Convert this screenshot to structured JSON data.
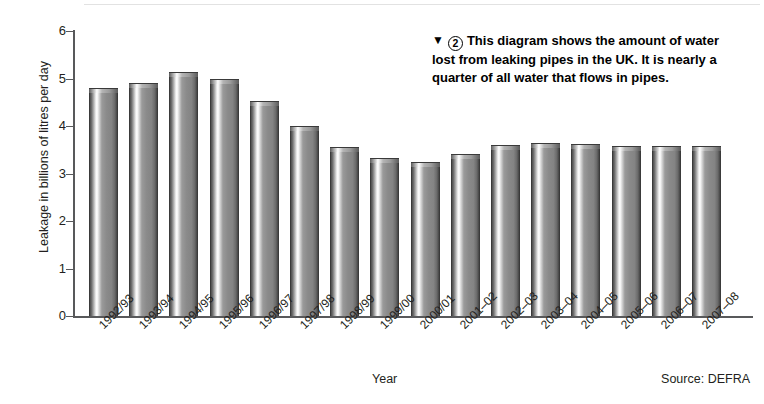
{
  "chart_data": {
    "type": "bar",
    "title": "",
    "xlabel": "Year",
    "ylabel": "Leakage in billions of litres per day",
    "ylim": [
      0,
      6
    ],
    "yticks": [
      0,
      1,
      2,
      3,
      4,
      5,
      6
    ],
    "grid": false,
    "legend": null,
    "categories": [
      "1992/93",
      "1993/94",
      "1994/95",
      "1995/96",
      "1996/97",
      "1997/98",
      "1998/99",
      "1999/00",
      "2000/01",
      "2001–02",
      "2002–03",
      "2003–04",
      "2004–05",
      "2005–06",
      "2006–07",
      "2007–08"
    ],
    "values": [
      4.8,
      4.9,
      5.13,
      5.0,
      4.53,
      4.0,
      3.55,
      3.32,
      3.25,
      3.42,
      3.6,
      3.65,
      3.62,
      3.58,
      3.58,
      3.58
    ],
    "source": "Source: DEFRA",
    "bar_color": "#8a8a8a"
  },
  "annotation": {
    "marker": "▼",
    "number": "2",
    "text": "This diagram shows the amount of water lost from leaking pipes in the UK. It is nearly a quarter of all water that flows in pipes."
  }
}
